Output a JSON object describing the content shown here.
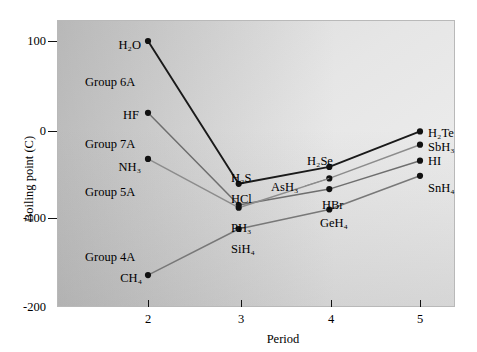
{
  "chart_data": {
    "type": "line",
    "title": "",
    "xlabel": "Period",
    "ylabel": "Boiling point (C)",
    "x": [
      2,
      3,
      4,
      5
    ],
    "xlim": [
      1.55,
      5.45
    ],
    "ylim": [
      -200,
      128
    ],
    "xticks": [
      "2",
      "3",
      "4",
      "5"
    ],
    "yticks": [
      "100",
      "0",
      "-100",
      "-200"
    ],
    "ytick_values": [
      100,
      0,
      -100,
      -200
    ],
    "grid": false,
    "legend": "inline-annotations",
    "series": [
      {
        "name": "Group 6A",
        "color": "#1a1a1a",
        "values": [
          100,
          -61,
          -42,
          -2
        ],
        "point_labels": [
          "H2O",
          "H2S",
          "H2Se",
          "H2Te"
        ]
      },
      {
        "name": "Group 7A",
        "color": "#6e6e6e",
        "values": [
          19,
          -85,
          -67,
          -35
        ],
        "point_labels": [
          "HF",
          "HCl",
          "HBr",
          "HI"
        ]
      },
      {
        "name": "Group 5A",
        "color": "#8c8c8c",
        "values": [
          -33,
          -88,
          -55,
          -17
        ],
        "point_labels": [
          "NH3",
          "PH3",
          "AsH3",
          "SbH3"
        ]
      },
      {
        "name": "Group 4A",
        "color": "#787878",
        "values": [
          -164,
          -112,
          -90,
          -52
        ],
        "point_labels": [
          "CH4",
          "SiH4",
          "GeH4",
          "SnH4"
        ]
      }
    ],
    "group_annotations": [
      "Group 6A",
      "Group 7A",
      "Group 5A",
      "Group 4A"
    ]
  },
  "axis": {
    "ylabel": "Boiling point (C)",
    "xlabel": "Period",
    "yticks": [
      "100",
      "0",
      "-100",
      "-200"
    ],
    "xticks": [
      "2",
      "3",
      "4",
      "5"
    ]
  },
  "labels": {
    "h2o": "H₂O",
    "h2s": "H₂S",
    "h2se": "H₂Se",
    "h2te": "H₂Te",
    "hf": "HF",
    "hcl": "HCl",
    "hbr": "HBr",
    "hi": "HI",
    "nh3": "NH₃",
    "ph3": "PH₃",
    "ash3": "AsH₃",
    "sbh3": "SbH₃",
    "ch4": "CH₄",
    "sih4": "SiH₄",
    "geh4": "GeH₄",
    "snh4": "SnH₄",
    "group6a": "Group 6A",
    "group7a": "Group 7A",
    "group5a": "Group 5A",
    "group4a": "Group 4A"
  },
  "colors": {
    "series_6a": "#1a1a1a",
    "series_7a": "#6e6e6e",
    "series_5a": "#8c8c8c",
    "series_4a": "#787878",
    "axis": "#111111",
    "frame": "#b9b9b9"
  }
}
